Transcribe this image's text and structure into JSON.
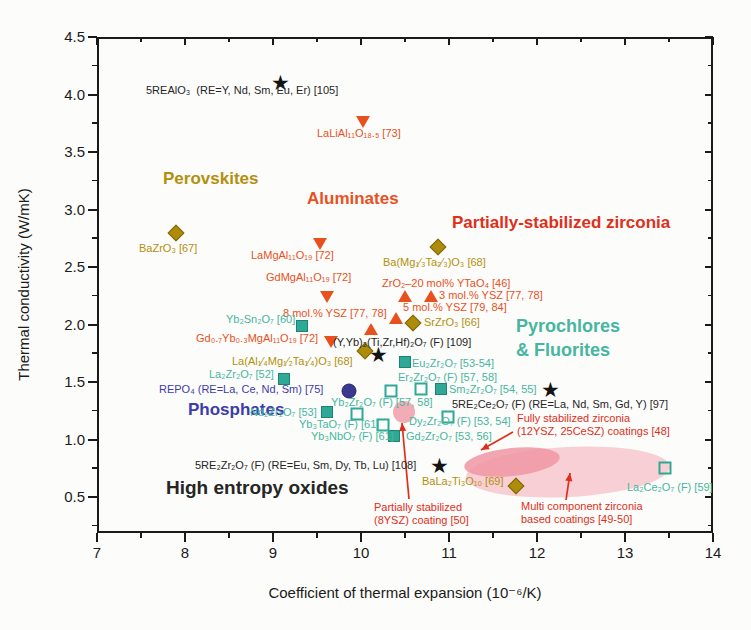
{
  "figure": {
    "background": "#fcfcfa",
    "width": 751,
    "height": 630
  },
  "palette": {
    "black": "#262626",
    "orange": "#e8511d",
    "red": "#df2f1b",
    "olive": "#b2900d",
    "teal": "#46b6a1",
    "blue": "#3c3caa"
  },
  "symbols": {
    "star": "★"
  },
  "layout": {
    "plot_left": 97,
    "plot_top": 37,
    "plot_right": 713,
    "plot_bottom": 533,
    "y_top_value": 4.5,
    "y_px_per_unit": 115,
    "x_px_per_unit": 88
  },
  "chart_data": {
    "type": "scatter",
    "title": "",
    "xlabel": "Coefficient of thermal expansion (10⁻⁶/K)",
    "ylabel": "Thermal conductivity (W/mK)",
    "xlim": [
      7,
      14
    ],
    "ylim": [
      0.2,
      4.5
    ],
    "x_ticks": [
      7,
      8,
      9,
      10,
      11,
      12,
      13,
      14
    ],
    "y_ticks": [
      4.5,
      4.0,
      3.5,
      3.0,
      2.5,
      2.0,
      1.5,
      1.0,
      0.5
    ],
    "grid": false,
    "legend": "none (labels annotated beside points)",
    "series": [
      {
        "name": "High entropy / multicomponent oxides",
        "marker": "star",
        "color": "#1c1c1c",
        "points": [
          {
            "x": 9.09,
            "y": 4.11,
            "label": "5REAlO₃ (RE=Y, Nd, Sm, Eu, Er) [105]"
          },
          {
            "x": 10.2,
            "y": 1.74,
            "label": "(Y,Yb)₂(Ti,Zr,Hf)₂O₇ (F) [109]"
          },
          {
            "x": 12.15,
            "y": 1.44,
            "label": "5RE₂Ce₂O₇ (F) (RE=La, Nd, Sm, Gd, Y) [97]"
          },
          {
            "x": 10.89,
            "y": 0.78,
            "label": "5RE₂Zr₂O₇ (F) (RE=Eu, Sm, Dy, Tb, Lu) [108]"
          }
        ]
      },
      {
        "name": "Aluminates",
        "marker": "triangle-down",
        "color": "#e8511d",
        "points": [
          {
            "x": 10.02,
            "y": 3.76,
            "label": "LaLiAl₁₁O₁₈.₅ [73]"
          },
          {
            "x": 9.53,
            "y": 2.7,
            "label": "LaMgAl₁₁O₁₉ [72]"
          },
          {
            "x": 9.61,
            "y": 2.24,
            "label": "GdMgAl₁₁O₁₉ [72]"
          },
          {
            "x": 9.66,
            "y": 1.85,
            "label": "Gd₀.₇Yb₀.₃MgAl₁₁O₁₉ [72]"
          }
        ]
      },
      {
        "name": "Partially-stabilized zirconia",
        "marker": "triangle-up",
        "color": "#e8511d",
        "points": [
          {
            "x": 10.5,
            "y": 2.25,
            "label": "ZrO₂–20 mol% YTaO₄ [46]"
          },
          {
            "x": 10.8,
            "y": 2.25,
            "label": "3 mol.% YSZ [77, 78]"
          },
          {
            "x": 10.4,
            "y": 2.06,
            "label": "5 mol.% YSZ [79, 84]"
          },
          {
            "x": 10.11,
            "y": 1.96,
            "label": "8 mol.% YSZ [77, 78]"
          }
        ]
      },
      {
        "name": "Perovskites",
        "marker": "diamond",
        "color": "#ad8c0c",
        "points": [
          {
            "x": 7.9,
            "y": 2.8,
            "label": "BaZrO₃ [67]"
          },
          {
            "x": 10.88,
            "y": 2.67,
            "label": "Ba(Mg₁⁄₃Ta₂⁄₃)O₃ [68]"
          },
          {
            "x": 10.59,
            "y": 2.01,
            "label": "SrZrO₃ [66]"
          },
          {
            "x": 10.05,
            "y": 1.77,
            "label": "La(Al₁⁄₄Mg₁⁄₂Ta₁⁄₄)O₃ [68]"
          },
          {
            "x": 11.76,
            "y": 0.6,
            "label": "BaLa₂Ti₃O₁₀ [69]"
          }
        ]
      },
      {
        "name": "Pyrochlores & fluorites (filled squares)",
        "marker": "square-filled",
        "color": "#2fa995",
        "points": [
          {
            "x": 9.33,
            "y": 1.99,
            "label": "Yb₂Sn₂O₇ [60]"
          },
          {
            "x": 9.13,
            "y": 1.53,
            "label": "La₂Zr₂O₇ [52]"
          },
          {
            "x": 10.5,
            "y": 1.67,
            "label": "Eu₂Zr₂O₇ [53-54]"
          },
          {
            "x": 10.91,
            "y": 1.44,
            "label": "Sm₂Zr₂O₇ [54, 55]"
          },
          {
            "x": 9.61,
            "y": 1.24,
            "label": "Nd₂Zr₂O₇ [53]"
          },
          {
            "x": 10.37,
            "y": 1.03,
            "label": "Yb₃NbO₇ (F) [61] / Gd₂Zr₂O₇ [53, 56]"
          }
        ]
      },
      {
        "name": "Pyrochlores & fluorites (open squares)",
        "marker": "square-open",
        "color": "#2fa995",
        "points": [
          {
            "x": 10.34,
            "y": 1.42,
            "label": "Yb₂Zr₂O₇ (F) [57, 58]"
          },
          {
            "x": 10.68,
            "y": 1.44,
            "label": "Er₂Zr₂O₇ (F) [57, 58]"
          },
          {
            "x": 9.95,
            "y": 1.22,
            "label": "Yb₂Zr₂O₇ (F) [57, 58]"
          },
          {
            "x": 10.99,
            "y": 1.2,
            "label": "Dy₂Zr₂O₇ (F) [53, 54]"
          },
          {
            "x": 10.25,
            "y": 1.13,
            "label": "Yb₃TaO₇ (F) [61]"
          },
          {
            "x": 13.45,
            "y": 0.75,
            "label": "La₂Ce₂O₇ (F) [59]"
          }
        ]
      },
      {
        "name": "Phosphates",
        "marker": "circle",
        "color": "#39398f",
        "points": [
          {
            "x": 9.86,
            "y": 1.42,
            "label": "REPO₄ (RE=La, Ce, Nd, Sm) [75]"
          }
        ]
      }
    ],
    "annotations": [
      {
        "t": "5REAlO₃  (RE=Y, Nd, Sm, Eu, Er) [105]",
        "x": 146,
        "y": 84,
        "c": "black"
      },
      {
        "t": "LaLiAl₁₁O₁₈.₅ [73]",
        "x": 317,
        "y": 127,
        "c": "orange"
      },
      {
        "t": "Perovskites",
        "x": 163,
        "y": 169,
        "c": "olive",
        "fs": 17,
        "b": 1
      },
      {
        "t": "Aluminates",
        "x": 307,
        "y": 189,
        "c": "orange",
        "fs": 17,
        "b": 1
      },
      {
        "t": "Partially-stabilized zirconia",
        "x": 452,
        "y": 213,
        "c": "red",
        "fs": 17,
        "b": 1
      },
      {
        "t": "BaZrO₃ [67]",
        "x": 139,
        "y": 242,
        "c": "olive"
      },
      {
        "t": "LaMgAl₁₁O₁₉ [72]",
        "x": 251,
        "y": 249,
        "c": "orange"
      },
      {
        "t": "Ba(Mg₁⁄₃Ta₂⁄₃)O₃ [68]",
        "x": 383,
        "y": 256,
        "c": "olive"
      },
      {
        "t": "GdMgAl₁₁O₁₉ [72]",
        "x": 266,
        "y": 271,
        "c": "orange"
      },
      {
        "t": "ZrO₂–20 mol% YTaO₄ [46]",
        "x": 382,
        "y": 277,
        "c": "orange"
      },
      {
        "t": "3 mol.% YSZ [77, 78]",
        "x": 439,
        "y": 289,
        "c": "orange"
      },
      {
        "t": "5 mol.% YSZ [79, 84]",
        "x": 403,
        "y": 301,
        "c": "orange"
      },
      {
        "t": "8 mol.% YSZ [77, 78]",
        "x": 283,
        "y": 307,
        "c": "orange"
      },
      {
        "t": "Yb₂Sn₂O₇ [60]",
        "x": 226,
        "y": 313,
        "c": "teal"
      },
      {
        "t": "SrZrO₃ [66]",
        "x": 424,
        "y": 316,
        "c": "olive"
      },
      {
        "t": "Pyrochlores",
        "x": 516,
        "y": 316,
        "c": "teal",
        "fs": 18,
        "b": 1
      },
      {
        "t": "& Fluorites",
        "x": 516,
        "y": 340,
        "c": "teal",
        "fs": 18,
        "b": 1
      },
      {
        "t": "Gd₀.₇Yb₀.₃MgAl₁₁O₁₉ [72]",
        "x": 196,
        "y": 332,
        "c": "orange"
      },
      {
        "t": "(Y,Yb)₂(Ti,Zr,Hf)₂O₇ (F) [109]",
        "x": 333,
        "y": 336,
        "c": "black"
      },
      {
        "t": "La(Al₁⁄₄Mg₁⁄₂Ta₁⁄₄)O₃ [68]",
        "x": 232,
        "y": 355,
        "c": "olive"
      },
      {
        "t": "Eu₂Zr₂O₇ [53-54]",
        "x": 412,
        "y": 357,
        "c": "teal"
      },
      {
        "t": "La₂Zr₂O₇ [52]",
        "x": 209,
        "y": 368,
        "c": "teal"
      },
      {
        "t": "Er₂Zr₂O₇ (F) [57, 58]",
        "x": 398,
        "y": 371,
        "c": "teal"
      },
      {
        "t": "REPO₄ (RE=La, Ce, Nd, Sm) [75]",
        "x": 159,
        "y": 383,
        "c": "blue"
      },
      {
        "t": "Sm₂Zr₂O₇ [54, 55]",
        "x": 449,
        "y": 383,
        "c": "teal"
      },
      {
        "t": "Yb₂Zr₂O₇ (F) [57, 58]",
        "x": 331,
        "y": 396,
        "c": "teal"
      },
      {
        "t": "5RE₂Ce₂O₇ (F) (RE=La, Nd, Sm, Gd, Y) [97]",
        "x": 452,
        "y": 398,
        "c": "black"
      },
      {
        "t": "Phosphates",
        "x": 188,
        "y": 400,
        "c": "blue",
        "fs": 17,
        "b": 1
      },
      {
        "t": "Nd₂Zr₂O₇ [53]",
        "x": 250,
        "y": 406,
        "c": "teal"
      },
      {
        "t": "Fully stabilized zirconia\n(12YSZ, 25CeSZ) coatings [48]",
        "x": 517,
        "y": 412,
        "c": "red"
      },
      {
        "t": "Dy₂Zr₂O₇ (F) [53, 54]",
        "x": 409,
        "y": 415,
        "c": "teal"
      },
      {
        "t": "Yb₃TaO₇ (F) [61]",
        "x": 299,
        "y": 418,
        "c": "teal"
      },
      {
        "t": "Yb₃NbO₇ (F) [61]",
        "x": 311,
        "y": 430,
        "c": "teal"
      },
      {
        "t": "Gd₂Zr₂O₇ [53, 56]",
        "x": 406,
        "y": 430,
        "c": "teal"
      },
      {
        "t": "5RE₂Zr₂O₇ (F) (RE=Eu, Sm, Dy, Tb, Lu) [108]",
        "x": 195,
        "y": 459,
        "c": "black"
      },
      {
        "t": "High entropy oxides",
        "x": 166,
        "y": 477,
        "c": "black",
        "fs": 19,
        "b": 1
      },
      {
        "t": "BaLa₂Ti₃O₁₀ [69]",
        "x": 422,
        "y": 475,
        "c": "olive"
      },
      {
        "t": "La₂Ce₂O₇ (F) [59]",
        "x": 627,
        "y": 481,
        "c": "teal"
      },
      {
        "t": "Partially stabilized\n(8YSZ) coating [50]",
        "x": 374,
        "y": 501,
        "c": "red"
      },
      {
        "t": "Multi component zirconia\nbased coatings [49-50]",
        "x": 521,
        "y": 500,
        "c": "red"
      }
    ],
    "regions": [
      {
        "label": "Multi component zirconia based coatings [49-50]",
        "cx": 568,
        "cy": 472,
        "rx": 102,
        "ry": 25,
        "rot": -3,
        "fill": "#f6c3cb",
        "opacity": 0.8
      },
      {
        "label": "Fully stabilized zirconia (12YSZ, 25CeSZ) coatings [48]",
        "cx": 512,
        "cy": 462,
        "rx": 48,
        "ry": 14,
        "rot": -6,
        "fill": "#ee97a3",
        "opacity": 0.85
      },
      {
        "label": "Partially stabilized (8YSZ) coating [50]",
        "cx": 404,
        "cy": 412,
        "rx": 11,
        "ry": 11,
        "rot": 0,
        "fill": "#f0a3ae",
        "opacity": 0.9
      }
    ],
    "arrows": [
      {
        "x1": 409,
        "y1": 499,
        "x2": 402,
        "y2": 423,
        "color": "#df2f1b"
      },
      {
        "x1": 513,
        "y1": 432,
        "x2": 481,
        "y2": 450,
        "color": "#df2f1b"
      },
      {
        "x1": 566,
        "y1": 500,
        "x2": 570,
        "y2": 473,
        "color": "#df2f1b"
      }
    ]
  }
}
